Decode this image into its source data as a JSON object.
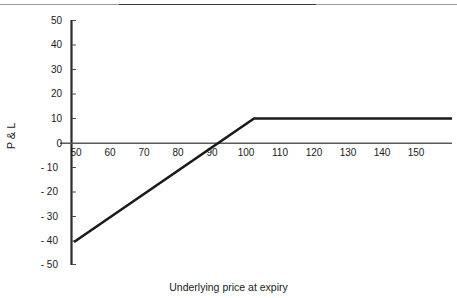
{
  "chart_data": {
    "type": "line",
    "title": "",
    "xlabel": "Underlying price at expiry",
    "ylabel": "P & L",
    "xlim": [
      45,
      155
    ],
    "ylim": [
      -50,
      50
    ],
    "grid": false,
    "legend": "none",
    "xticks": [
      50,
      60,
      70,
      80,
      90,
      100,
      110,
      120,
      130,
      140,
      150
    ],
    "xtick_labels": [
      "50",
      "60",
      "70",
      "80",
      "90",
      "100",
      "110",
      "120",
      "130",
      "140",
      "150"
    ],
    "yticks": [
      50,
      40,
      30,
      20,
      10,
      0,
      -10,
      -20,
      -30,
      -40,
      -50
    ],
    "ytick_labels": [
      "50",
      "40",
      "30",
      "20",
      "10",
      "0",
      "- 10",
      "- 20",
      "- 30",
      "- 40",
      "- 50"
    ],
    "series": [
      {
        "name": "P & L at expiry",
        "color": "#1a1a1a",
        "x": [
          50,
          100,
          150
        ],
        "values": [
          -40,
          10,
          10
        ]
      }
    ],
    "breakeven_x": 90,
    "max_profit": 10,
    "strike": 100
  },
  "axis": {
    "zero_line_label": "zero-line",
    "y_axis_label": "y-axis",
    "x_axis_label": "x-axis"
  }
}
